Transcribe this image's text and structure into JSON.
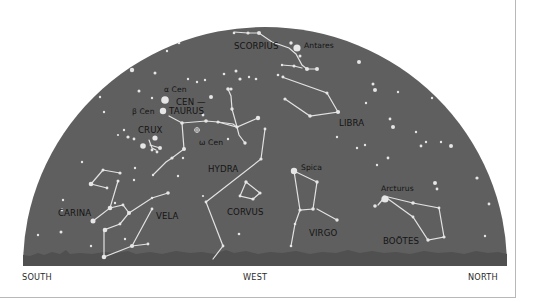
{
  "diagram": {
    "type": "sky-chart",
    "view": "Western sky, southern hemisphere horizon",
    "colors": {
      "sky": "#5f5f5f",
      "ground": "#4f4f4f",
      "star": "#e6e6e6",
      "line": "#e2e2e2",
      "label": "#141414",
      "background": "#ffffff",
      "frame": "#b8b8b8"
    },
    "directions": {
      "left": "SOUTH",
      "center": "WEST",
      "right": "NORTH"
    },
    "constellations": [
      {
        "id": "scorpius",
        "label": "SCORPIUS"
      },
      {
        "id": "centaurus",
        "label_line1": "CEN —",
        "label_line2": "TAURUS"
      },
      {
        "id": "crux",
        "label": "CRUX"
      },
      {
        "id": "libra",
        "label": "LIBRA"
      },
      {
        "id": "hydra",
        "label": "HYDRA"
      },
      {
        "id": "corvus",
        "label": "CORVUS"
      },
      {
        "id": "carina",
        "label": "CARINA"
      },
      {
        "id": "vela",
        "label": "VELA"
      },
      {
        "id": "virgo",
        "label": "VIRGO"
      },
      {
        "id": "bootes",
        "label": "BOÖTES"
      }
    ],
    "named_stars": [
      {
        "id": "antares",
        "label": "Antares"
      },
      {
        "id": "alpha-cen",
        "label": "α Cen"
      },
      {
        "id": "beta-cen",
        "label": "β Cen"
      },
      {
        "id": "omega-cen",
        "label": "ω Cen"
      },
      {
        "id": "spica",
        "label": "Spica"
      },
      {
        "id": "arcturus",
        "label": "Arcturus"
      }
    ]
  }
}
